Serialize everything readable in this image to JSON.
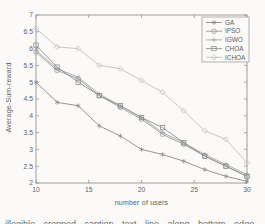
{
  "figure": {
    "background": "#fbfaf8",
    "frame_color": "#979590",
    "tick_label_color": "#636363",
    "caption_fragment": "illegible cropped caption text line along bottom edge"
  },
  "chart_data": {
    "type": "line",
    "title": "",
    "xlabel": "number of users",
    "ylabel": "Average-Sum-reward",
    "xlim": [
      10,
      30
    ],
    "ylim": [
      2,
      7
    ],
    "xticks": [
      10,
      15,
      20,
      25,
      30
    ],
    "yticks": [
      2,
      2.5,
      3,
      3.5,
      4,
      4.5,
      5,
      5.5,
      6,
      6.5,
      7
    ],
    "grid": false,
    "x": [
      10,
      12,
      14,
      16,
      18,
      20,
      22,
      24,
      26,
      28,
      30
    ],
    "series": [
      {
        "name": "GA",
        "marker": "asterisk",
        "color": "#8b8b8b",
        "values": [
          5.0,
          4.4,
          4.3,
          3.7,
          3.4,
          3.0,
          2.85,
          2.65,
          2.4,
          2.2,
          2.05
        ]
      },
      {
        "name": "IPSO",
        "marker": "circle",
        "color": "#9a9a9a",
        "values": [
          5.9,
          5.35,
          5.1,
          4.6,
          4.25,
          3.9,
          3.45,
          3.15,
          2.8,
          2.5,
          2.2
        ]
      },
      {
        "name": "IGWO",
        "marker": "plus",
        "color": "#a6a6a6",
        "values": [
          5.95,
          5.4,
          5.15,
          4.65,
          4.3,
          3.95,
          3.5,
          3.2,
          2.85,
          2.55,
          2.25
        ]
      },
      {
        "name": "CHOA",
        "marker": "square",
        "color": "#8f8f8f",
        "values": [
          6.1,
          5.45,
          5.0,
          4.6,
          4.3,
          3.95,
          3.65,
          3.2,
          2.8,
          2.5,
          2.2
        ]
      },
      {
        "name": "ICHOA",
        "marker": "diamond",
        "color": "#c2c1bd",
        "values": [
          6.6,
          6.05,
          6.0,
          5.5,
          5.4,
          5.05,
          4.7,
          4.15,
          3.55,
          3.3,
          2.6
        ]
      }
    ],
    "legend": {
      "position": "top-right",
      "entries": [
        "GA",
        "IPSO",
        "IGWO",
        "CHOA",
        "ICHOA"
      ]
    }
  }
}
